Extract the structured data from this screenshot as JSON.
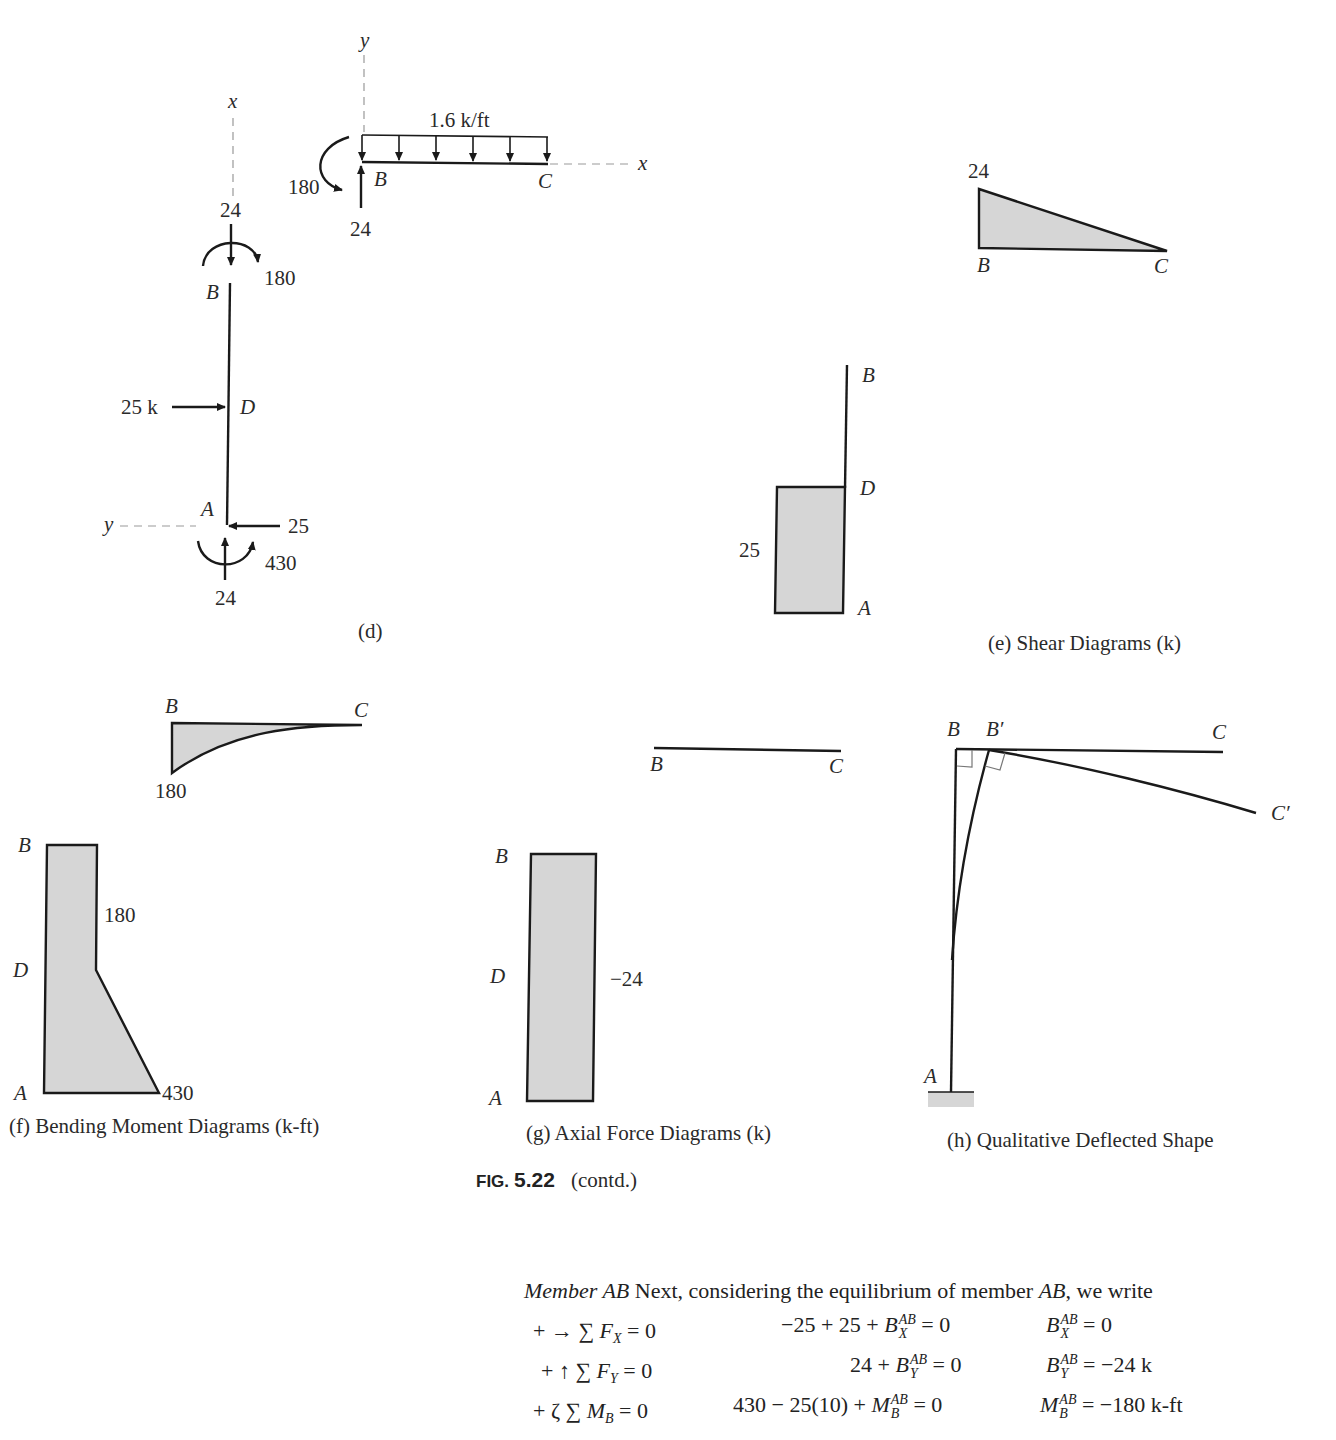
{
  "header": {
    "running_head_partial": "",
    "page_number_partial": ""
  },
  "panel_d": {
    "caption": "(d)",
    "beam_bc": {
      "axis_y": "y",
      "axis_x": "x",
      "load_label": "1.6 k/ft",
      "moment_label": "180",
      "reaction_label": "24",
      "node_b": "B",
      "node_c": "C"
    },
    "column_ab": {
      "axis_x": "x",
      "axis_y": "y",
      "top_axial": "24",
      "top_moment": "180",
      "node_b": "B",
      "node_d": "D",
      "node_a": "A",
      "applied_load": "25 k",
      "base_shear": "25",
      "base_moment": "430",
      "base_axial": "24"
    }
  },
  "panel_e": {
    "caption": "(e) Shear Diagrams (k)",
    "beam": {
      "value": "24",
      "node_b": "B",
      "node_c": "C"
    },
    "column": {
      "value": "25",
      "node_b": "B",
      "node_d": "D",
      "node_a": "A"
    }
  },
  "panel_f": {
    "caption": "(f) Bending Moment Diagrams (k-ft)",
    "beam": {
      "value": "180",
      "node_b": "B",
      "node_c": "C"
    },
    "column": {
      "value_d": "180",
      "value_a": "430",
      "node_b": "B",
      "node_d": "D",
      "node_a": "A"
    }
  },
  "panel_g": {
    "caption": "(g) Axial Force Diagrams (k)",
    "beam": {
      "node_b": "B",
      "node_c": "C"
    },
    "column": {
      "value": "−24",
      "node_b": "B",
      "node_d": "D",
      "node_a": "A"
    }
  },
  "panel_h": {
    "caption": "(h) Qualitative Deflected Shape",
    "labels": {
      "b": "B",
      "b_prime": "B′",
      "c": "C",
      "c_prime": "C′",
      "a": "A"
    }
  },
  "figure": {
    "label": "FIG.",
    "number": "5.22",
    "suffix": "(contd.)"
  },
  "text": {
    "intro_italic": "Member AB",
    "intro_rest": " Next, considering the equilibrium of member ",
    "intro_member": "AB",
    "intro_end": ", we write",
    "equations": [
      {
        "condition": "+ → ∑ F_X = 0",
        "cond_sign": "+ → ∑",
        "cond_var": "F",
        "cond_sub": "X",
        "cond_rhs": " = 0",
        "expr_pre": "−25 + 25 + ",
        "expr_var": "B",
        "expr_sup": "AB",
        "expr_sub": "X",
        "expr_post": " = 0",
        "res_var": "B",
        "res_sup": "AB",
        "res_sub": "X",
        "res_post": " = 0"
      },
      {
        "condition": "+ ↑ ∑ F_Y = 0",
        "cond_sign": "+ ↑ ∑",
        "cond_var": "F",
        "cond_sub": "Y",
        "cond_rhs": " = 0",
        "expr_pre": "24 + ",
        "expr_var": "B",
        "expr_sup": "AB",
        "expr_sub": "Y",
        "expr_post": " = 0",
        "res_var": "B",
        "res_sup": "AB",
        "res_sub": "Y",
        "res_post": " = −24 k"
      },
      {
        "condition": "+ ζ ∑ M_B = 0",
        "cond_sign": "+ ζ ∑",
        "cond_var": "M",
        "cond_sub": "B",
        "cond_rhs": " = 0",
        "expr_pre": "430 − 25(10) + ",
        "expr_var": "M",
        "expr_sup": "AB",
        "expr_sub": "B",
        "expr_post": " = 0",
        "res_var": "M",
        "res_sup": "AB",
        "res_sub": "B",
        "res_post": " = −180 k-ft"
      }
    ]
  }
}
